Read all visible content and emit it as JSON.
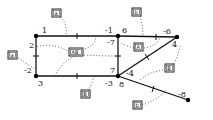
{
  "diagram": {
    "nodes": [
      {
        "id": "n1",
        "x": 36,
        "y": 36
      },
      {
        "id": "n2",
        "x": 118,
        "y": 36
      },
      {
        "id": "n3",
        "x": 177,
        "y": 37
      },
      {
        "id": "n4",
        "x": 36,
        "y": 76
      },
      {
        "id": "n5",
        "x": 118,
        "y": 76
      },
      {
        "id": "n6",
        "x": 188,
        "y": 100
      }
    ],
    "port_labels": {
      "l1": "1",
      "l2": "2",
      "lm1": "-1",
      "l6": "6",
      "lm7": "-7",
      "lm6": "-6",
      "l4": "4",
      "lm2": "-2",
      "l3": "3",
      "l7": "7",
      "lm3": "-3",
      "l8": "8",
      "lm4": "-4",
      "lm8": "-8"
    },
    "boxes": {
      "b_top_left": "a",
      "b_top_right": "b",
      "b_center": "AB",
      "b_right_mid": "A",
      "b_left": "a",
      "b_bottom_mid": "B",
      "b_right_low": "B",
      "b_bottom_right": "b"
    }
  }
}
